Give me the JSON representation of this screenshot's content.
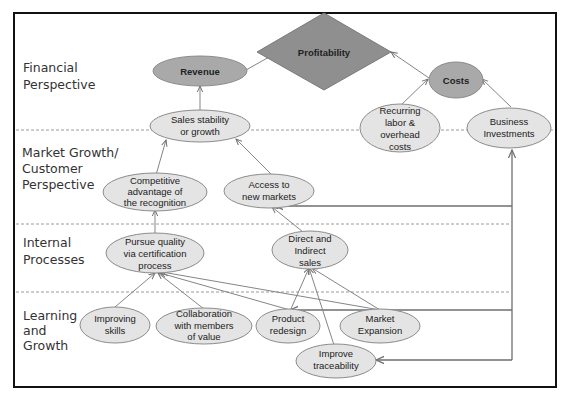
{
  "perspectives": [
    {
      "id": "financial",
      "lines": [
        "Financial",
        "Perspective"
      ]
    },
    {
      "id": "market",
      "lines": [
        "Market Growth/",
        "Customer",
        "Perspective"
      ]
    },
    {
      "id": "internal",
      "lines": [
        "Internal",
        "Processes"
      ]
    },
    {
      "id": "learning",
      "lines": [
        "Learning",
        "and",
        "Growth"
      ]
    }
  ],
  "nodes": {
    "profitability": {
      "lines": [
        "Profitability"
      ],
      "shape": "diamond"
    },
    "revenue": {
      "lines": [
        "Revenue"
      ],
      "shape": "ellipse-dark"
    },
    "costs": {
      "lines": [
        "Costs"
      ],
      "shape": "ellipse-dark"
    },
    "sales_stability": {
      "lines": [
        "Sales stability",
        "or growth"
      ]
    },
    "recurring_costs": {
      "lines": [
        "Recurring",
        "labor &",
        "overhead",
        "costs"
      ]
    },
    "business_investments": {
      "lines": [
        "Business",
        "Investments"
      ]
    },
    "competitive_advantage": {
      "lines": [
        "Competitive",
        "advantage of",
        "the recognition"
      ]
    },
    "access_markets": {
      "lines": [
        "Access to",
        "new markets"
      ]
    },
    "pursue_quality": {
      "lines": [
        "Pursue quality",
        "via certification",
        "process"
      ]
    },
    "direct_sales": {
      "lines": [
        "Direct and",
        "Indirect",
        "sales"
      ]
    },
    "improving_skills": {
      "lines": [
        "Improving",
        "skills"
      ]
    },
    "collaboration": {
      "lines": [
        "Collaboration",
        "with members",
        "of value"
      ]
    },
    "product_redesign": {
      "lines": [
        "Product",
        "redesign"
      ]
    },
    "market_expansion": {
      "lines": [
        "Market",
        "Expansion"
      ]
    },
    "improve_traceability": {
      "lines": [
        "Improve",
        "traceability"
      ]
    }
  },
  "edges": [
    {
      "from": "Revenue",
      "to": "Profitability"
    },
    {
      "from": "Costs",
      "to": "Profitability"
    },
    {
      "from": "Sales stability or growth",
      "to": "Revenue"
    },
    {
      "from": "Recurring labor & overhead costs",
      "to": "Costs"
    },
    {
      "from": "Business Investments",
      "to": "Costs"
    },
    {
      "from": "Competitive advantage of the recognition",
      "to": "Sales stability or growth"
    },
    {
      "from": "Access to new markets",
      "to": "Sales stability or growth"
    },
    {
      "from": "Pursue quality via certification process",
      "to": "Competitive advantage of the recognition"
    },
    {
      "from": "Direct and Indirect sales",
      "to": "Access to new markets"
    },
    {
      "from": "Business Investments",
      "to": "Access to new markets"
    },
    {
      "from": "Improving skills",
      "to": "Pursue quality via certification process"
    },
    {
      "from": "Collaboration with members of value",
      "to": "Pursue quality via certification process"
    },
    {
      "from": "Product redesign",
      "to": "Pursue quality via certification process"
    },
    {
      "from": "Market Expansion",
      "to": "Pursue quality via certification process"
    },
    {
      "from": "Product redesign",
      "to": "Direct and Indirect sales"
    },
    {
      "from": "Market Expansion",
      "to": "Direct and Indirect sales"
    },
    {
      "from": "Improve traceability",
      "to": "Direct and Indirect sales"
    },
    {
      "from": "Business Investments",
      "to": "Product redesign"
    },
    {
      "from": "Business Investments",
      "to": "Market Expansion"
    },
    {
      "from": "Business Investments",
      "to": "Improve traceability"
    }
  ],
  "colors": {
    "node_fill": "#e4e4e4",
    "node_dark_fill": "#a9a9a9",
    "diamond_fill": "#8f8f8f",
    "edge": "#858585",
    "frame": "#111111"
  }
}
